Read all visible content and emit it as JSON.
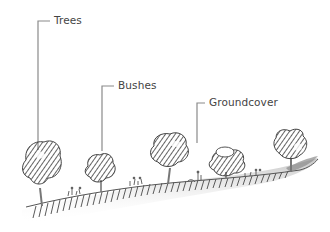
{
  "diagram": {
    "type": "illustrated-callout-diagram",
    "style": "pencil-sketch",
    "labels": [
      {
        "id": "trees",
        "text": "Trees"
      },
      {
        "id": "bushes",
        "text": "Bushes"
      },
      {
        "id": "groundcover",
        "text": "Groundcover"
      }
    ],
    "colors": {
      "leader_line": "#8a8a8a",
      "label_text": "#444444",
      "canopy_dark": "#4a4a4a",
      "canopy_mid": "#7a7a7a",
      "ground_hatch": "#6a6a6a",
      "ground_shadow": "#cfcfcf"
    }
  }
}
